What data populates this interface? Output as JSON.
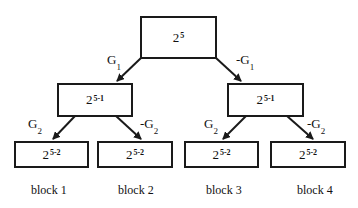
{
  "root": {
    "base": "2",
    "exp": "5"
  },
  "level1": [
    {
      "base": "2",
      "exp": "5-1",
      "edge_label": "G",
      "edge_sub": "1"
    },
    {
      "base": "2",
      "exp": "5-1",
      "edge_label": "-G",
      "edge_sub": "1"
    }
  ],
  "level2": [
    {
      "base": "2",
      "exp": "5-2",
      "edge_label": "G",
      "edge_sub": "2",
      "block": "block 1"
    },
    {
      "base": "2",
      "exp": "5-2",
      "edge_label": "-G",
      "edge_sub": "2",
      "block": "block 2"
    },
    {
      "base": "2",
      "exp": "5-2",
      "edge_label": "G",
      "edge_sub": "2",
      "block": "block 3"
    },
    {
      "base": "2",
      "exp": "5-2",
      "edge_label": "-G",
      "edge_sub": "2",
      "block": "block 4"
    }
  ],
  "colors": {
    "stroke": "#1a1a1a",
    "background": "#ffffff"
  }
}
